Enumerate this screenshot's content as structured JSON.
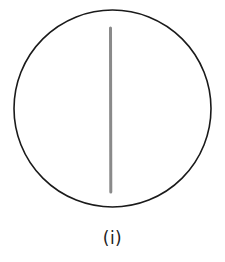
{
  "figure": {
    "circle": {
      "cx": 112.5,
      "cy": 108.5,
      "r": 98.5,
      "stroke": "#1a1a1a",
      "stroke_width": 1.6
    },
    "line": {
      "x1": 110.5,
      "y1": 28,
      "x2": 110.8,
      "y2": 192,
      "stroke": "#8a8a8a",
      "stroke_width": 3
    },
    "caption": "(i)"
  }
}
